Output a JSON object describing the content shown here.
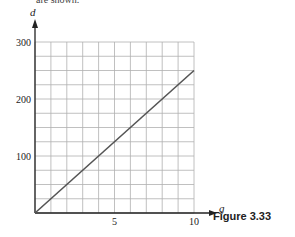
{
  "header": {
    "cut_text": "are shown."
  },
  "figure": {
    "caption": "Figure 3.33"
  },
  "axes": {
    "x_var": "g",
    "y_var": "d",
    "x_ticks": [
      {
        "value": 5,
        "label": "5"
      },
      {
        "value": 10,
        "label": "10"
      }
    ],
    "y_ticks": [
      {
        "value": 100,
        "label": "100"
      },
      {
        "value": 200,
        "label": "200"
      },
      {
        "value": 300,
        "label": "300"
      }
    ]
  },
  "colors": {
    "grid": "#b0b0b0",
    "axis": "#222222",
    "line": "#555555"
  },
  "chart_data": {
    "type": "line",
    "title": "Figure 3.33",
    "xlabel": "g",
    "ylabel": "d",
    "xlim": [
      0,
      10
    ],
    "ylim": [
      0,
      300
    ],
    "grid": true,
    "x_grid_step": 1,
    "y_grid_step": 25,
    "x_ticks": [
      5,
      10
    ],
    "y_ticks": [
      100,
      200,
      300
    ],
    "series": [
      {
        "name": "d = 25g",
        "x": [
          0,
          10
        ],
        "y": [
          0,
          250
        ]
      }
    ]
  }
}
